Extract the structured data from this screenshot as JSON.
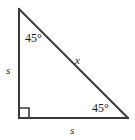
{
  "figure": {
    "name": "right-isosceles-triangle",
    "background_color": "#ffffff",
    "stroke_color": "#3a3a3a",
    "text_color": "#1a1a1a",
    "vertices": {
      "top": [
        19,
        9
      ],
      "bottom_left": [
        19,
        118
      ],
      "bottom_right": [
        128,
        118
      ]
    },
    "right_angle_marker": {
      "at": "bottom_left",
      "size": 9
    },
    "labels": {
      "angle_top": "45°",
      "angle_bottom_right": "45°",
      "side_left": "s",
      "side_bottom": "s",
      "hypotenuse": "x"
    }
  }
}
